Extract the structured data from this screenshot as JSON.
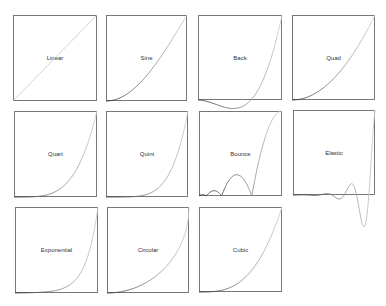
{
  "chart_data": {
    "type": "line",
    "title": "",
    "layout": "grid of small-multiple easing curves, 4 columns × 3 rows",
    "xlabel": "",
    "ylabel": "",
    "xlim": [
      0,
      1
    ],
    "ylim": [
      0,
      1
    ],
    "grid": false,
    "panels": [
      {
        "name": "Linear",
        "function": "t",
        "samples": {
          "x": [
            0,
            0.25,
            0.5,
            0.75,
            1
          ],
          "y": [
            0,
            0.25,
            0.5,
            0.75,
            1
          ]
        }
      },
      {
        "name": "Sine",
        "function": "1 - cos(t*pi/2)",
        "samples": {
          "x": [
            0,
            0.25,
            0.5,
            0.75,
            1
          ],
          "y": [
            0,
            0.076,
            0.293,
            0.617,
            1
          ]
        }
      },
      {
        "name": "Back",
        "function": "2.70158*t^3 - 1.70158*t^2",
        "samples": {
          "x": [
            0,
            0.25,
            0.5,
            0.75,
            1
          ],
          "y": [
            0,
            -0.064,
            -0.088,
            0.183,
            1
          ]
        }
      },
      {
        "name": "Quad",
        "function": "t^2",
        "samples": {
          "x": [
            0,
            0.25,
            0.5,
            0.75,
            1
          ],
          "y": [
            0,
            0.063,
            0.25,
            0.563,
            1
          ]
        }
      },
      {
        "name": "Quart",
        "function": "t^4",
        "samples": {
          "x": [
            0,
            0.25,
            0.5,
            0.75,
            1
          ],
          "y": [
            0,
            0.004,
            0.063,
            0.316,
            1
          ]
        }
      },
      {
        "name": "Quint",
        "function": "t^5",
        "samples": {
          "x": [
            0,
            0.25,
            0.5,
            0.75,
            1
          ],
          "y": [
            0,
            0.001,
            0.031,
            0.237,
            1
          ]
        }
      },
      {
        "name": "Bounce",
        "function": "1 - easeOutBounce(1 - t)",
        "samples": {
          "x": [
            0,
            0.25,
            0.5,
            0.75,
            1
          ],
          "y": [
            0,
            0.027,
            0.234,
            0.527,
            1
          ]
        }
      },
      {
        "name": "Elastic",
        "function": "-2^(10(t-1)) * sin((t-1.075)*2pi/0.3)",
        "samples": {
          "x": [
            0,
            0.25,
            0.5,
            0.75,
            1
          ],
          "y": [
            0,
            -0.005,
            -0.016,
            0.088,
            1
          ]
        }
      },
      {
        "name": "Exponential",
        "function": "2^(10(t-1))",
        "samples": {
          "x": [
            0,
            0.25,
            0.5,
            0.75,
            1
          ],
          "y": [
            0.001,
            0.005,
            0.031,
            0.177,
            1
          ]
        }
      },
      {
        "name": "Circular",
        "function": "1 - sqrt(1 - t^2)",
        "samples": {
          "x": [
            0,
            0.25,
            0.5,
            0.75,
            1
          ],
          "y": [
            0,
            0.032,
            0.134,
            0.339,
            1
          ]
        }
      },
      {
        "name": "Cubic",
        "function": "t^3",
        "samples": {
          "x": [
            0,
            0.25,
            0.5,
            0.75,
            1
          ],
          "y": [
            0,
            0.016,
            0.125,
            0.422,
            1
          ]
        }
      }
    ]
  },
  "panels": {
    "linear": {
      "label": "Linear"
    },
    "sine": {
      "label": "Sine"
    },
    "back": {
      "label": "Back"
    },
    "quad": {
      "label": "Quad"
    },
    "quart": {
      "label": "Quart"
    },
    "quint": {
      "label": "Quint"
    },
    "bounce": {
      "label": "Bounce"
    },
    "elastic": {
      "label": "Elastic"
    },
    "exponential": {
      "label": "Exponential"
    },
    "circular": {
      "label": "Circular"
    },
    "cubic": {
      "label": "Cubic"
    }
  },
  "colors": {
    "frame": "#777777",
    "curve_start": "#2a2a2a",
    "curve_end": "#d0d0d0",
    "label": "#333333",
    "background": "#ffffff"
  }
}
